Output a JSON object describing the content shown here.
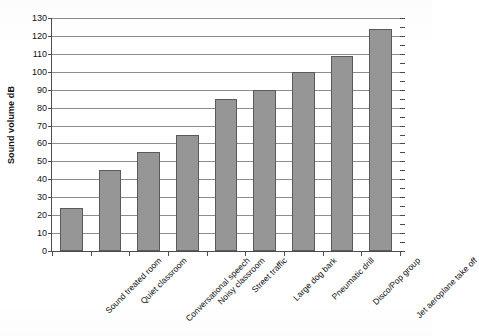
{
  "chart_data": {
    "type": "bar",
    "title": "",
    "xlabel": "",
    "ylabel": "Sound volume dB",
    "ylim": [
      0,
      130
    ],
    "ytick_step": 10,
    "yticks": [
      130,
      120,
      110,
      100,
      90,
      80,
      70,
      60,
      50,
      40,
      30,
      20,
      10,
      0
    ],
    "grid": true,
    "legend": false,
    "legend_position": "none",
    "bar_color": "#969696",
    "bar_border_color": "#5a5a5a",
    "gridline_color": "#8c8c8c",
    "axis_color": "#4d4d4d",
    "categories": [
      "Sound treated room",
      "Quiet classroom",
      "Conversational speech",
      "Noisy classroom",
      "Street traffic",
      "Large dog bark",
      "Pneumatic drill",
      "Disco/Pop group",
      "Jet aeroplane take off"
    ],
    "values": [
      24,
      45,
      55,
      65,
      85,
      90,
      100,
      109,
      124
    ]
  }
}
